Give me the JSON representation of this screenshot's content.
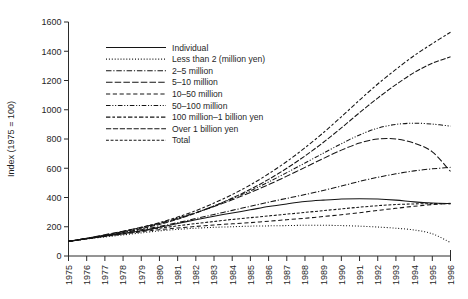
{
  "chart_data": {
    "type": "line",
    "title": "",
    "xlabel": "",
    "ylabel": "Index (1975 = 100)",
    "xlim": [
      1975,
      1996
    ],
    "ylim": [
      0,
      1600
    ],
    "ytick_step": 200,
    "grid": false,
    "legend_position": "upper-left-inside",
    "x": [
      1975,
      1976,
      1977,
      1978,
      1979,
      1980,
      1981,
      1982,
      1983,
      1984,
      1985,
      1986,
      1987,
      1988,
      1989,
      1990,
      1991,
      1992,
      1993,
      1994,
      1995,
      1996
    ],
    "yticks": [
      0,
      200,
      400,
      600,
      800,
      1000,
      1200,
      1400,
      1600
    ],
    "xticks": [
      "1975",
      "1976",
      "1977",
      "1978",
      "1979",
      "1980",
      "1981",
      "1982",
      "1983",
      "1984",
      "1985",
      "1986",
      "1987",
      "1988",
      "1989",
      "1990",
      "1991",
      "1992",
      "1993",
      "1994",
      "1995",
      "1996"
    ],
    "series": [
      {
        "name": "Individual",
        "dash": "none",
        "values": [
          100,
          118,
          136,
          152,
          172,
          196,
          222,
          248,
          272,
          294,
          316,
          338,
          356,
          372,
          382,
          390,
          392,
          390,
          382,
          370,
          362,
          358
        ]
      },
      {
        "name": "Less than 2 (million yen)",
        "dash": "dotted",
        "values": [
          100,
          116,
          130,
          144,
          158,
          172,
          182,
          190,
          196,
          200,
          204,
          206,
          208,
          210,
          210,
          208,
          204,
          198,
          190,
          178,
          152,
          92
        ]
      },
      {
        "name": "2–5 million",
        "dash": "dashdot",
        "values": [
          100,
          120,
          140,
          160,
          180,
          202,
          228,
          256,
          284,
          312,
          340,
          368,
          394,
          420,
          448,
          478,
          510,
          538,
          562,
          582,
          596,
          606
        ]
      },
      {
        "name": "5–10 million",
        "dash": "longdash",
        "values": [
          100,
          122,
          146,
          170,
          196,
          224,
          258,
          296,
          338,
          384,
          434,
          488,
          546,
          606,
          666,
          724,
          772,
          800,
          800,
          772,
          712,
          578
        ]
      },
      {
        "name": "10–50 million",
        "dash": "dashed",
        "values": [
          100,
          118,
          134,
          150,
          166,
          180,
          192,
          202,
          212,
          220,
          228,
          238,
          248,
          258,
          270,
          282,
          296,
          312,
          326,
          340,
          352,
          360
        ]
      },
      {
        "name": "50–100 million",
        "dash": "dashdotdot",
        "values": [
          100,
          120,
          142,
          166,
          192,
          222,
          256,
          296,
          342,
          392,
          446,
          506,
          570,
          636,
          702,
          768,
          828,
          874,
          900,
          908,
          902,
          888
        ]
      },
      {
        "name": "100 million–1 billion yen",
        "dash": "longdashdash",
        "values": [
          100,
          120,
          142,
          168,
          196,
          228,
          266,
          310,
          362,
          420,
          486,
          562,
          646,
          740,
          842,
          952,
          1066,
          1176,
          1276,
          1370,
          1452,
          1530
        ]
      },
      {
        "name": "Over 1 billion yen",
        "dash": "mediumdash",
        "values": [
          100,
          118,
          138,
          160,
          186,
          216,
          252,
          294,
          342,
          396,
          456,
          524,
          600,
          684,
          776,
          876,
          980,
          1080,
          1172,
          1254,
          1318,
          1362
        ]
      },
      {
        "name": "Total",
        "dash": "shortdash",
        "values": [
          100,
          118,
          136,
          154,
          172,
          190,
          206,
          222,
          236,
          250,
          262,
          274,
          286,
          298,
          310,
          322,
          334,
          344,
          352,
          356,
          358,
          358
        ]
      }
    ]
  },
  "axis": {
    "y_title": "Index (1975 = 100)"
  },
  "legend": {
    "items": [
      {
        "label": "Individual"
      },
      {
        "label": "Less than 2 (million yen)"
      },
      {
        "label": "2–5 million"
      },
      {
        "label": "5–10 million"
      },
      {
        "label": "10–50 million"
      },
      {
        "label": "50–100 million"
      },
      {
        "label": "100 million–1 billion yen"
      },
      {
        "label": "Over 1 billion yen"
      },
      {
        "label": "Total"
      }
    ]
  }
}
